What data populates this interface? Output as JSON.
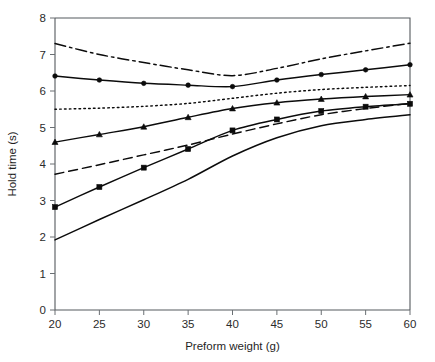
{
  "chart_data": {
    "type": "line",
    "title": "",
    "xlabel": "Preform weight (g)",
    "ylabel": "Hold time (s)",
    "x": [
      20,
      25,
      30,
      35,
      40,
      45,
      50,
      55,
      60
    ],
    "xtick_labels": [
      "20",
      "25",
      "30",
      "35",
      "40",
      "45",
      "50",
      "55",
      "60"
    ],
    "ytick_labels": [
      "0",
      "1",
      "2",
      "3",
      "4",
      "5",
      "6",
      "7",
      "8"
    ],
    "xlim": [
      20,
      60
    ],
    "ylim": [
      0,
      8
    ],
    "grid": false,
    "legend": "none",
    "axis_spacing": "equal",
    "series": [
      {
        "name": "series-1-dashdot",
        "linestyle": "dashdot",
        "marker": "none",
        "color": "#0b0b0b",
        "values": [
          7.3,
          7.0,
          6.78,
          6.58,
          6.42,
          6.62,
          6.88,
          7.1,
          7.31
        ]
      },
      {
        "name": "series-2-solid-circle",
        "linestyle": "solid",
        "marker": "circle",
        "color": "#0b0b0b",
        "values": [
          6.41,
          6.3,
          6.21,
          6.16,
          6.12,
          6.3,
          6.45,
          6.58,
          6.72
        ]
      },
      {
        "name": "series-3-dotted",
        "linestyle": "dotted",
        "marker": "none",
        "color": "#0b0b0b",
        "values": [
          5.5,
          5.53,
          5.58,
          5.66,
          5.8,
          5.94,
          6.04,
          6.1,
          6.15
        ]
      },
      {
        "name": "series-4-solid-triangle",
        "linestyle": "solid",
        "marker": "triangle",
        "color": "#0b0b0b",
        "values": [
          4.6,
          4.81,
          5.02,
          5.28,
          5.52,
          5.68,
          5.78,
          5.85,
          5.9
        ]
      },
      {
        "name": "series-5-dashed",
        "linestyle": "dashed",
        "marker": "none",
        "color": "#0b0b0b",
        "values": [
          3.72,
          3.98,
          4.25,
          4.52,
          4.82,
          5.1,
          5.35,
          5.52,
          5.66
        ]
      },
      {
        "name": "series-6-solid-square",
        "linestyle": "solid",
        "marker": "square",
        "color": "#0b0b0b",
        "values": [
          2.82,
          3.37,
          3.9,
          4.41,
          4.92,
          5.22,
          5.45,
          5.57,
          5.65
        ]
      },
      {
        "name": "series-7-solid-plain",
        "linestyle": "solid",
        "marker": "none",
        "color": "#0b0b0b",
        "values": [
          1.92,
          2.48,
          3.02,
          3.58,
          4.22,
          4.72,
          5.05,
          5.22,
          5.35
        ]
      }
    ]
  }
}
